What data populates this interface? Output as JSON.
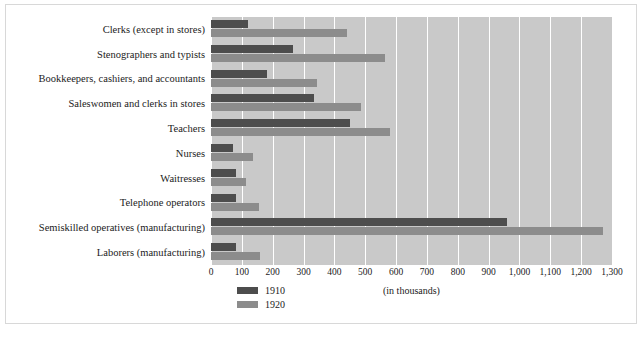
{
  "chart_data": {
    "type": "bar",
    "orientation": "horizontal",
    "title": "",
    "xlabel": "(in thousands)",
    "ylabel": "",
    "xlim": [
      0,
      1300
    ],
    "xticks": [
      0,
      100,
      200,
      300,
      400,
      500,
      600,
      700,
      800,
      900,
      1000,
      1100,
      1200,
      1300
    ],
    "xtick_labels": [
      "0",
      "100",
      "200",
      "300",
      "400",
      "500",
      "600",
      "700",
      "800",
      "900",
      "1,000",
      "1,100",
      "1,200",
      "1,300"
    ],
    "grid": true,
    "legend_position": "bottom-left",
    "categories": [
      "Clerks (except in stores)",
      "Stenographers and typists",
      "Bookkeepers, cashiers, and accountants",
      "Saleswomen and clerks in stores",
      "Teachers",
      "Nurses",
      "Waitresses",
      "Telephone operators",
      "Semiskilled operatives (manufacturing)",
      "Laborers (manufacturing)"
    ],
    "series": [
      {
        "name": "1910",
        "color": "#4d4d4d",
        "values": [
          120,
          265,
          180,
          335,
          450,
          70,
          80,
          80,
          960,
          80
        ]
      },
      {
        "name": "1920",
        "color": "#8c8c8c",
        "values": [
          440,
          565,
          345,
          485,
          580,
          135,
          115,
          155,
          1270,
          160
        ]
      }
    ]
  },
  "legend": {
    "items": [
      {
        "label": "1910",
        "color": "#4d4d4d"
      },
      {
        "label": "1920",
        "color": "#8c8c8c"
      }
    ]
  },
  "axis_title": "(in thousands)",
  "caption": ""
}
